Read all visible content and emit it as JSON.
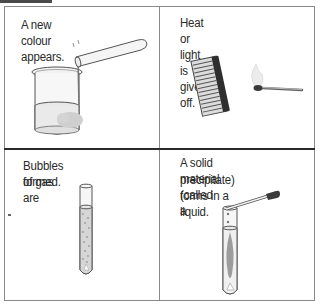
{
  "panels": [
    {
      "caption": "A new colour appears.",
      "illustration": "beaker-with-test-tube-pouring-icon"
    },
    {
      "caption": "Heat or light is given off.",
      "illustration": "matchbook-and-lit-match-icon"
    },
    {
      "caption_lines": [
        "Bubbles of gas are",
        "formed."
      ],
      "illustration": "test-tube-with-bubbles-icon"
    },
    {
      "caption_lines": [
        "A solid material (called a",
        "precipitate) forms in a liquid."
      ],
      "illustration": "test-tube-with-dropper-precipitate-icon"
    }
  ],
  "colors": {
    "border": "#8a8a8a",
    "divider": "#2a2a2a",
    "text": "#2a2a2a",
    "tab": "#4a4a4a"
  }
}
